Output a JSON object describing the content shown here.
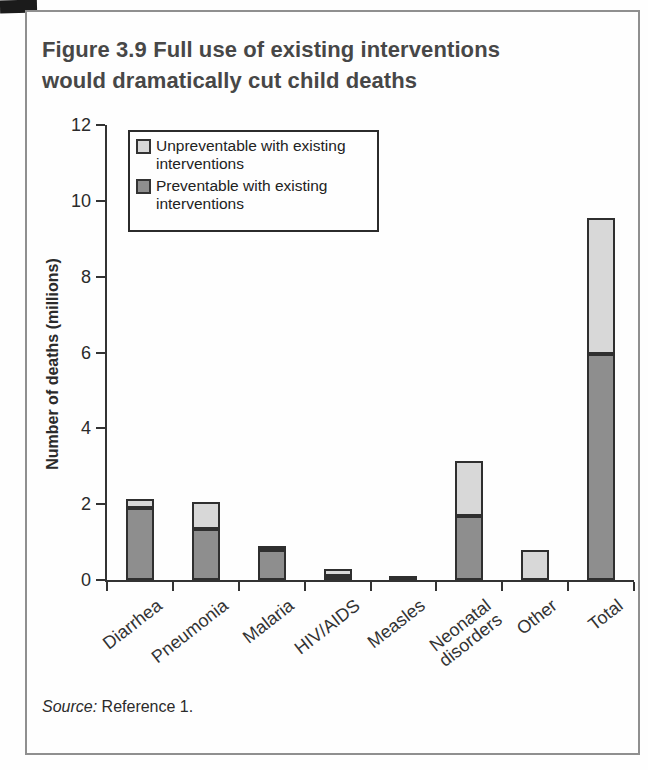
{
  "figure": {
    "title_line1": "Figure 3.9  Full use of existing interventions",
    "title_line2": "would dramatically cut child deaths"
  },
  "legend": {
    "items": [
      {
        "key": "unpreventable",
        "label": "Unpreventable with existing\ninterventions",
        "color": "#d8d8d8"
      },
      {
        "key": "preventable",
        "label": "Preventable with existing\ninterventions",
        "color": "#8e8e8e"
      }
    ]
  },
  "source": {
    "label": "Source:",
    "text": "Reference 1."
  },
  "colors": {
    "preventable_fill": "#8e8e8e",
    "unpreventable_fill": "#d8d8d8",
    "bar_border": "#2f2f2f",
    "axis": "#333333",
    "frame_border": "#8f8f8f",
    "title_text": "#474747"
  },
  "chart_data": {
    "type": "bar",
    "stacked": true,
    "title": "Figure 3.9 Full use of existing interventions would dramatically cut child deaths",
    "xlabel": "",
    "ylabel": "Number of deaths (millions)",
    "ylim": [
      0,
      12
    ],
    "yticks": [
      0,
      2,
      4,
      6,
      8,
      10,
      12
    ],
    "grid": false,
    "legend_position": "upper-left",
    "categories": [
      "Diarrhea",
      "Pneumonia",
      "Malaria",
      "HIV/AIDS",
      "Measles",
      "Neonatal\ndisorders",
      "Other",
      "Total"
    ],
    "series": [
      {
        "name": "Preventable with existing interventions",
        "color": "#8e8e8e",
        "values": [
          1.9,
          1.35,
          0.8,
          0.1,
          0.1,
          1.7,
          0,
          5.95
        ]
      },
      {
        "name": "Unpreventable with existing interventions",
        "color": "#d8d8d8",
        "values": [
          0.25,
          0.7,
          0.1,
          0.2,
          0,
          1.45,
          0.8,
          3.6
        ]
      }
    ],
    "totals": [
      2.15,
      2.05,
      0.9,
      0.3,
      0.1,
      3.15,
      0.8,
      9.55
    ],
    "source": "Source: Reference 1."
  }
}
